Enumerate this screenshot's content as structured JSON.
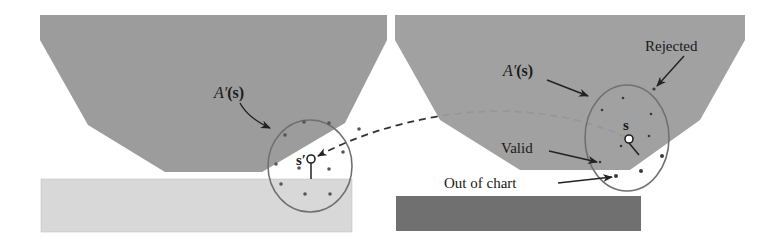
{
  "diagram": {
    "left_panel": {
      "region_label": "A′(s)",
      "region_label_italic": "A′",
      "region_label_arg": "(s)",
      "point_label": "s′",
      "obstacle_color": "#9a9a9a",
      "lower_region_color": "#d6d6d6"
    },
    "right_panel": {
      "region_label": "A′(s)",
      "region_label_italic": "A′",
      "region_label_arg": "(s)",
      "point_label": "s",
      "annotations": {
        "rejected": "Rejected",
        "valid": "Valid",
        "out_of_chart": "Out of chart"
      },
      "obstacle_color": "#9a9a9a",
      "lower_region_color": "#6e6e6e"
    },
    "colors": {
      "ellipse_stroke": "#707070",
      "sample_dot": "#4a4a4a",
      "arrow": "#222222",
      "dashed_path": "#333333"
    }
  }
}
